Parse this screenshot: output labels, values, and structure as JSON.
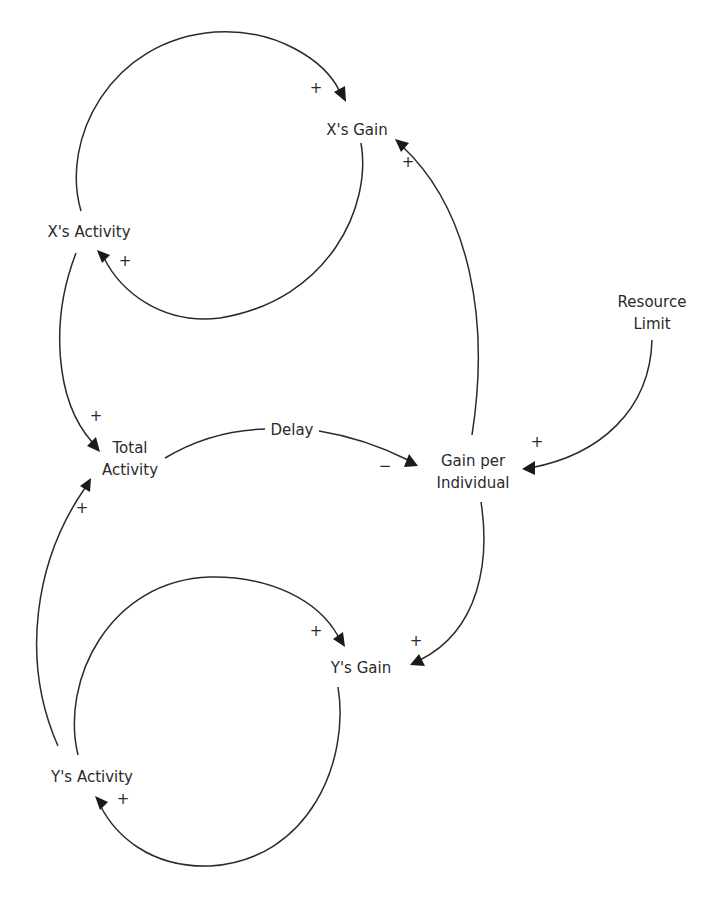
{
  "diagram": {
    "type": "causal-loop-diagram",
    "nodes": {
      "x_gain": "X's Gain",
      "x_activity": "X's Activity",
      "total_activity_line1": "Total",
      "total_activity_line2": "Activity",
      "delay": "Delay",
      "gain_per_individual_line1": "Gain per",
      "gain_per_individual_line2": "Individual",
      "resource_limit_line1": "Resource",
      "resource_limit_line2": "Limit",
      "y_gain": "Y's Gain",
      "y_activity": "Y's Activity"
    },
    "links": [
      {
        "from": "X's Activity",
        "to": "X's Gain",
        "polarity": "+"
      },
      {
        "from": "X's Gain",
        "to": "X's Activity",
        "polarity": "+"
      },
      {
        "from": "X's Activity",
        "to": "Total Activity",
        "polarity": "+"
      },
      {
        "from": "Y's Activity",
        "to": "Total Activity",
        "polarity": "+"
      },
      {
        "from": "Total Activity",
        "to": "Gain per Individual",
        "polarity": "−",
        "label": "Delay"
      },
      {
        "from": "Resource Limit",
        "to": "Gain per Individual",
        "polarity": "+"
      },
      {
        "from": "Gain per Individual",
        "to": "X's Gain",
        "polarity": "+"
      },
      {
        "from": "Gain per Individual",
        "to": "Y's Gain",
        "polarity": "+"
      },
      {
        "from": "Y's Activity",
        "to": "Y's Gain",
        "polarity": "+"
      },
      {
        "from": "Y's Gain",
        "to": "Y's Activity",
        "polarity": "+"
      }
    ],
    "polarity_labels": {
      "xact_to_xgain": "+",
      "xgain_to_xact": "+",
      "xact_to_total": "+",
      "yact_to_total": "+",
      "total_to_gpi": "−",
      "resource_to_gpi": "+",
      "gpi_to_xgain": "+",
      "gpi_to_ygain": "+",
      "yact_to_ygain": "+",
      "ygain_to_yact": "+"
    },
    "colors": {
      "line": "#2a2a2a",
      "text": "#2a2a2a",
      "background": "#ffffff"
    }
  }
}
